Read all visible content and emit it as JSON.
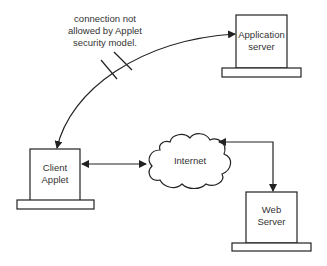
{
  "nodes": {
    "app_server": {
      "label": "Application\nserver"
    },
    "client_applet": {
      "label": "Client\nApplet"
    },
    "web_server": {
      "label": "Web\nServer"
    },
    "internet": {
      "label": "Internet"
    }
  },
  "annotation": {
    "text": "connection not\nallowed by Applet\nsecurity model."
  },
  "colors": {
    "stroke": "#222222",
    "text": "#333333",
    "background": "#ffffff"
  }
}
